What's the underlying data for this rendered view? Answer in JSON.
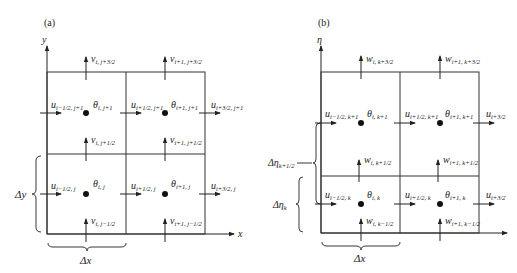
{
  "panels": [
    {
      "id": "a",
      "label": "(a)",
      "y_axis_label": "y",
      "x_axis_label": "x",
      "dx_label": "Δx",
      "dy_label": "Δy",
      "theta": [
        {
          "sym": "θ",
          "sub": "i, j+1"
        },
        {
          "sym": "θ",
          "sub": "i+1, j+1"
        },
        {
          "sym": "θ",
          "sub": "i, j"
        },
        {
          "sym": "θ",
          "sub": "i+1, j"
        }
      ],
      "u": [
        {
          "sym": "u",
          "sub": "i−1/2, j+1"
        },
        {
          "sym": "u",
          "sub": "i+1/2, j+1"
        },
        {
          "sym": "u",
          "sub": "i+3/2, j+1"
        },
        {
          "sym": "u",
          "sub": "i−1/2, j"
        },
        {
          "sym": "u",
          "sub": "i+1/2, j"
        },
        {
          "sym": "u",
          "sub": "i+3/2, j"
        }
      ],
      "v": [
        {
          "sym": "v",
          "sub": "i, j+3/2"
        },
        {
          "sym": "v",
          "sub": "i+1, j+3/2"
        },
        {
          "sym": "v",
          "sub": "i, j+1/2"
        },
        {
          "sym": "v",
          "sub": "i+1, j+1/2"
        },
        {
          "sym": "v",
          "sub": "i, j−1/2"
        },
        {
          "sym": "v",
          "sub": "i+1, j−1/2"
        }
      ]
    },
    {
      "id": "b",
      "label": "(b)",
      "y_axis_label": "η",
      "dx_label": "Δx",
      "deta_k_label": "Δη",
      "deta_k_sub": "k",
      "deta_k12_label": "Δη",
      "deta_k12_sub": "k+1/2",
      "theta": [
        {
          "sym": "θ",
          "sub": "i, k+1"
        },
        {
          "sym": "θ",
          "sub": "i+1, k+1"
        },
        {
          "sym": "θ",
          "sub": "i, k"
        },
        {
          "sym": "θ",
          "sub": "i+1, k"
        }
      ],
      "u": [
        {
          "sym": "u",
          "sub": "i−1/2, k+1"
        },
        {
          "sym": "u",
          "sub": "i+1/2, k+1"
        },
        {
          "sym": "u",
          "sub": "i+3/2"
        },
        {
          "sym": "u",
          "sub": "i−1/2, k"
        },
        {
          "sym": "u",
          "sub": "i+1/2, k"
        },
        {
          "sym": "u",
          "sub": "i+3/2"
        }
      ],
      "w": [
        {
          "sym": "w",
          "sub": "i, k+3/2"
        },
        {
          "sym": "w",
          "sub": "i+1, k+3/2"
        },
        {
          "sym": "w",
          "sub": "i, k+1/2"
        },
        {
          "sym": "w",
          "sub": "i+1, k+1/2"
        },
        {
          "sym": "w",
          "sub": "i, k−1/2"
        },
        {
          "sym": "w",
          "sub": "i+1, k−1/2"
        }
      ]
    }
  ]
}
